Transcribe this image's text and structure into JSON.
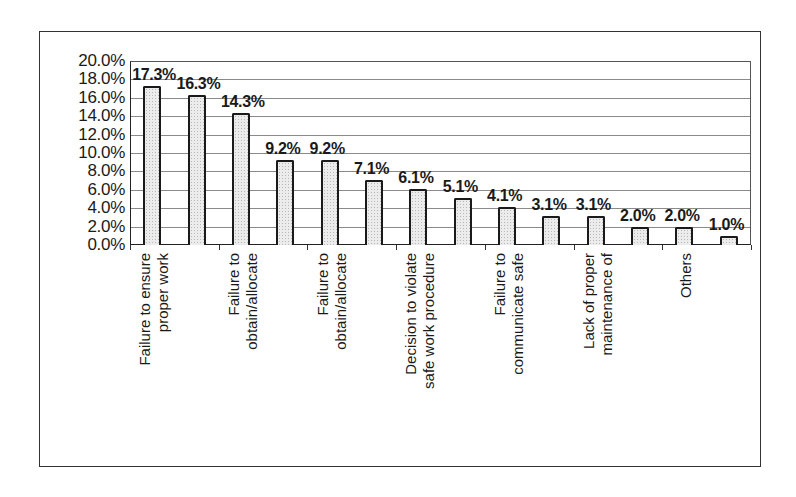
{
  "chart_data": {
    "type": "bar",
    "title": "",
    "xlabel": "",
    "ylabel": "",
    "ylim": [
      0,
      20
    ],
    "grid": true,
    "legend": null,
    "y_ticks": [
      "0.0%",
      "2.0%",
      "4.0%",
      "6.0%",
      "8.0%",
      "10.0%",
      "12.0%",
      "14.0%",
      "16.0%",
      "18.0%",
      "20.0%"
    ],
    "categories": [
      "Failure to ensure proper work",
      "",
      "Failure to obtain/allocate",
      "",
      "Failure to obtain/allocate",
      "",
      "Decision to violate safe work procedure",
      "",
      "Failure to communicate safe",
      "",
      "Lack of proper maintenance of",
      "",
      "Others",
      ""
    ],
    "values": [
      17.3,
      16.3,
      14.3,
      9.2,
      9.2,
      7.1,
      6.1,
      5.1,
      4.1,
      3.1,
      3.1,
      2.0,
      2.0,
      1.0
    ],
    "value_labels": [
      "17.3%",
      "16.3%",
      "14.3%",
      "9.2%",
      "9.2%",
      "7.1%",
      "6.1%",
      "5.1%",
      "4.1%",
      "3.1%",
      "3.1%",
      "2.0%",
      "2.0%",
      "1.0%"
    ],
    "x_label_lines": [
      [
        "Failure to ensure",
        "proper work"
      ],
      [
        "Failure to",
        "obtain/allocate"
      ],
      [
        "Failure to",
        "obtain/allocate"
      ],
      [
        "Decision to violate",
        "safe work procedure"
      ],
      [
        "Failure to",
        "communicate safe"
      ],
      [
        "Lack of proper",
        "maintenance of"
      ],
      [
        "Others"
      ]
    ],
    "colors": {
      "bar_fill": "#ececec",
      "bar_outline": "#1a1a1a",
      "grid": "#8a8a8a"
    }
  }
}
